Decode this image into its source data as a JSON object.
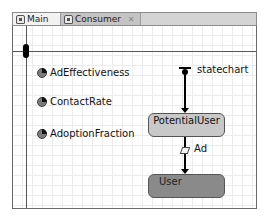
{
  "tabs": [
    {
      "label": "Main",
      "icon": "agent-type-icon",
      "active": false
    },
    {
      "label": "Consumer",
      "icon": "agent-type-icon",
      "active": true,
      "close": "✕"
    }
  ],
  "parameters": [
    {
      "label": "AdEffectiveness",
      "icon": "parameter-icon"
    },
    {
      "label": "ContactRate",
      "icon": "parameter-icon"
    },
    {
      "label": "AdoptionFraction",
      "icon": "parameter-icon"
    }
  ],
  "statechart": {
    "entry_label": "statechart",
    "states": [
      {
        "label": "PotentialUser",
        "color": "#c8c8c8"
      },
      {
        "label": "User",
        "color": "#8a8a8a"
      }
    ],
    "transitions": [
      {
        "label": "Ad",
        "from": "PotentialUser",
        "to": "User",
        "icon": "message-transition-icon"
      }
    ]
  }
}
